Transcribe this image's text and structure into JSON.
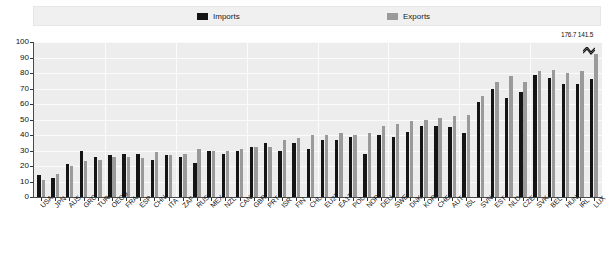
{
  "legend": {
    "position": "top",
    "items": [
      {
        "label": "Imports",
        "color": "#141414",
        "icon": "legend-swatch-imports"
      },
      {
        "label": "Exports",
        "color": "#9a9a9a",
        "icon": "legend-swatch-exports"
      }
    ]
  },
  "annotations": {
    "outlier_label": "176.7 141.5"
  },
  "chart_data": {
    "type": "bar",
    "title": "",
    "subtitle": "",
    "xlabel": "",
    "ylabel": "",
    "ylim": [
      0,
      100
    ],
    "yticks": [
      0,
      10,
      20,
      30,
      40,
      50,
      60,
      70,
      80,
      90,
      100
    ],
    "grid": true,
    "legend_position": "top",
    "categories": [
      "USA",
      "JPN",
      "AUS",
      "GRC",
      "TUR",
      "OECD",
      "FRA",
      "ESP",
      "CHN",
      "ITA",
      "ZAF",
      "RUS",
      "MEX",
      "NZL",
      "CAN",
      "GBR",
      "PRT",
      "ISR",
      "FIN",
      "CHL",
      "EU27",
      "EA17",
      "POL",
      "NOR",
      "DEU",
      "SWE",
      "DNK",
      "KOR",
      "CHE",
      "AUT",
      "ISL",
      "SVN",
      "EST",
      "NLD",
      "CZE",
      "SVK",
      "BEL",
      "HUN",
      "IRL",
      "LUX"
    ],
    "series": [
      {
        "name": "Imports",
        "color": "#141414",
        "values": [
          14,
          12,
          21,
          30,
          26,
          27,
          28,
          28,
          24,
          27,
          26,
          22,
          30,
          28,
          30,
          32,
          35,
          30,
          35,
          31,
          37,
          37,
          39,
          28,
          40,
          39,
          42,
          46,
          46,
          45,
          41,
          61,
          70,
          64,
          68,
          79,
          77,
          73,
          73,
          76
        ]
      },
      {
        "name": "Exports",
        "color": "#9a9a9a",
        "values": [
          11,
          15,
          20,
          23,
          24,
          26,
          26,
          25,
          29,
          27,
          28,
          31,
          30,
          30,
          31,
          32,
          32,
          37,
          38,
          40,
          40,
          41,
          40,
          41,
          46,
          47,
          49,
          50,
          51,
          52,
          53,
          65,
          74,
          78,
          74,
          81,
          82,
          80,
          81,
          92
        ]
      }
    ]
  }
}
